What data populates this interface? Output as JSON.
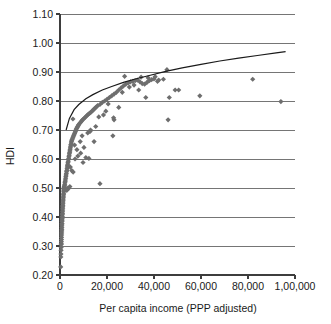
{
  "chart_data": {
    "type": "scatter",
    "title": "",
    "xlabel": "Per capita income (PPP adjusted)",
    "ylabel": "HDI",
    "xlim": [
      0,
      100000
    ],
    "ylim": [
      0.2,
      1.1
    ],
    "grid": "horizontal",
    "legend": "none",
    "marker_style": "diamond",
    "marker_color": "#6e6e6e",
    "trend_line_color": "#1a1a1a",
    "xticks": [
      0,
      20000,
      40000,
      60000,
      80000,
      100000
    ],
    "xtick_labels": [
      "0",
      "20,000",
      "40,000",
      "60,000",
      "80,000",
      "1,00,000"
    ],
    "yticks": [
      0.2,
      0.3,
      0.4,
      0.5,
      0.6,
      0.7,
      0.8,
      0.9,
      1.0,
      1.1
    ],
    "ytick_labels": [
      "0.20",
      "0.30",
      "0.40",
      "0.50",
      "0.60",
      "0.70",
      "0.80",
      "0.90",
      "1.00",
      "1.10"
    ],
    "series": [
      {
        "name": "Countries",
        "points": [
          [
            300,
            0.228
          ],
          [
            350,
            0.262
          ],
          [
            420,
            0.272
          ],
          [
            450,
            0.285
          ],
          [
            500,
            0.295
          ],
          [
            520,
            0.305
          ],
          [
            560,
            0.308
          ],
          [
            600,
            0.315
          ],
          [
            640,
            0.322
          ],
          [
            660,
            0.33
          ],
          [
            700,
            0.338
          ],
          [
            720,
            0.345
          ],
          [
            760,
            0.352
          ],
          [
            790,
            0.358
          ],
          [
            820,
            0.365
          ],
          [
            840,
            0.372
          ],
          [
            860,
            0.378
          ],
          [
            900,
            0.385
          ],
          [
            930,
            0.39
          ],
          [
            960,
            0.396
          ],
          [
            990,
            0.402
          ],
          [
            1010,
            0.408
          ],
          [
            1050,
            0.412
          ],
          [
            1080,
            0.418
          ],
          [
            1120,
            0.424
          ],
          [
            1150,
            0.43
          ],
          [
            1180,
            0.435
          ],
          [
            1220,
            0.44
          ],
          [
            1260,
            0.446
          ],
          [
            1300,
            0.452
          ],
          [
            1340,
            0.458
          ],
          [
            1380,
            0.462
          ],
          [
            1420,
            0.468
          ],
          [
            1460,
            0.472
          ],
          [
            1500,
            0.478
          ],
          [
            1540,
            0.482
          ],
          [
            1580,
            0.488
          ],
          [
            1620,
            0.492
          ],
          [
            1680,
            0.496
          ],
          [
            1720,
            0.5
          ],
          [
            1760,
            0.502
          ],
          [
            1800,
            0.505
          ],
          [
            1850,
            0.498
          ],
          [
            1900,
            0.494
          ],
          [
            1950,
            0.508
          ],
          [
            2000,
            0.512
          ],
          [
            2100,
            0.518
          ],
          [
            2200,
            0.522
          ],
          [
            2300,
            0.528
          ],
          [
            2400,
            0.534
          ],
          [
            2500,
            0.54
          ],
          [
            2600,
            0.545
          ],
          [
            2700,
            0.55
          ],
          [
            2800,
            0.556
          ],
          [
            2900,
            0.56
          ],
          [
            3000,
            0.566
          ],
          [
            3100,
            0.572
          ],
          [
            3200,
            0.578
          ],
          [
            3300,
            0.582
          ],
          [
            3400,
            0.588
          ],
          [
            3500,
            0.592
          ],
          [
            3600,
            0.598
          ],
          [
            3700,
            0.602
          ],
          [
            3800,
            0.608
          ],
          [
            3900,
            0.612
          ],
          [
            4000,
            0.618
          ],
          [
            4100,
            0.622
          ],
          [
            4200,
            0.628
          ],
          [
            4300,
            0.632
          ],
          [
            4400,
            0.638
          ],
          [
            4500,
            0.642
          ],
          [
            4600,
            0.648
          ],
          [
            4700,
            0.65
          ],
          [
            4800,
            0.655
          ],
          [
            4900,
            0.66
          ],
          [
            5000,
            0.665
          ],
          [
            5200,
            0.668
          ],
          [
            5400,
            0.672
          ],
          [
            5600,
            0.676
          ],
          [
            5800,
            0.68
          ],
          [
            6000,
            0.684
          ],
          [
            6200,
            0.688
          ],
          [
            6400,
            0.692
          ],
          [
            6600,
            0.696
          ],
          [
            6800,
            0.7
          ],
          [
            7000,
            0.704
          ],
          [
            7200,
            0.707
          ],
          [
            7400,
            0.71
          ],
          [
            7600,
            0.713
          ],
          [
            7800,
            0.716
          ],
          [
            8000,
            0.719
          ],
          [
            8400,
            0.723
          ],
          [
            8800,
            0.727
          ],
          [
            9200,
            0.731
          ],
          [
            9600,
            0.735
          ],
          [
            10000,
            0.738
          ],
          [
            10500,
            0.742
          ],
          [
            11000,
            0.746
          ],
          [
            11500,
            0.75
          ],
          [
            12000,
            0.754
          ],
          [
            12500,
            0.757
          ],
          [
            13000,
            0.76
          ],
          [
            13500,
            0.764
          ],
          [
            14000,
            0.768
          ],
          [
            14500,
            0.772
          ],
          [
            15000,
            0.776
          ],
          [
            15500,
            0.78
          ],
          [
            16000,
            0.784
          ],
          [
            17000,
            0.788
          ],
          [
            18000,
            0.795
          ],
          [
            19000,
            0.8
          ],
          [
            20000,
            0.806
          ],
          [
            21000,
            0.812
          ],
          [
            22000,
            0.818
          ],
          [
            23000,
            0.824
          ],
          [
            24000,
            0.83
          ],
          [
            25000,
            0.838
          ],
          [
            26000,
            0.845
          ],
          [
            27000,
            0.852
          ],
          [
            28000,
            0.858
          ],
          [
            29000,
            0.862
          ],
          [
            30000,
            0.866
          ],
          [
            31000,
            0.868
          ],
          [
            32000,
            0.87
          ],
          [
            33000,
            0.872
          ],
          [
            34000,
            0.866
          ],
          [
            35000,
            0.86
          ],
          [
            36000,
            0.858
          ],
          [
            37000,
            0.864
          ],
          [
            38000,
            0.87
          ],
          [
            39000,
            0.874
          ],
          [
            40000,
            0.876
          ],
          [
            42000,
            0.872
          ],
          [
            44000,
            0.875
          ],
          [
            5500,
            0.738
          ],
          [
            6200,
            0.648
          ],
          [
            7200,
            0.632
          ],
          [
            8600,
            0.66
          ],
          [
            9800,
            0.588
          ],
          [
            11000,
            0.605
          ],
          [
            12300,
            0.602
          ],
          [
            13000,
            0.7
          ],
          [
            14500,
            0.66
          ],
          [
            17000,
            0.515
          ],
          [
            22500,
            0.68
          ],
          [
            23000,
            0.735
          ],
          [
            22800,
            0.742
          ],
          [
            25000,
            0.778
          ],
          [
            27500,
            0.885
          ],
          [
            33500,
            0.838
          ],
          [
            36500,
            0.812
          ],
          [
            45500,
            0.908
          ],
          [
            46000,
            0.735
          ],
          [
            46500,
            0.812
          ],
          [
            49000,
            0.838
          ],
          [
            50500,
            0.838
          ],
          [
            59500,
            0.818
          ],
          [
            82000,
            0.875
          ],
          [
            94000,
            0.798
          ],
          [
            3400,
            0.5
          ],
          [
            3600,
            0.498
          ],
          [
            2900,
            0.492
          ],
          [
            4200,
            0.505
          ],
          [
            5000,
            0.56
          ],
          [
            5600,
            0.555
          ],
          [
            4400,
            0.572
          ],
          [
            6400,
            0.6
          ],
          [
            7600,
            0.61
          ],
          [
            8800,
            0.62
          ],
          [
            10200,
            0.64
          ],
          [
            9400,
            0.68
          ],
          [
            11800,
            0.69
          ],
          [
            12800,
            0.695
          ],
          [
            15200,
            0.712
          ],
          [
            16500,
            0.745
          ],
          [
            18500,
            0.752
          ],
          [
            19500,
            0.765
          ],
          [
            20500,
            0.79
          ],
          [
            26500,
            0.83
          ],
          [
            29500,
            0.848
          ],
          [
            31500,
            0.855
          ],
          [
            34500,
            0.882
          ],
          [
            37500,
            0.88
          ],
          [
            40500,
            0.884
          ],
          [
            41500,
            0.868
          ]
        ]
      }
    ],
    "trend": {
      "name": "Logarithmic fit",
      "description": "Rising logarithmic curve from about 0.72 at low income to 0.97 at the right edge",
      "points": [
        [
          2600,
          0.7
        ],
        [
          4000,
          0.74
        ],
        [
          6000,
          0.77
        ],
        [
          8000,
          0.788
        ],
        [
          11000,
          0.808
        ],
        [
          14000,
          0.822
        ],
        [
          18000,
          0.838
        ],
        [
          22000,
          0.85
        ],
        [
          27000,
          0.864
        ],
        [
          32000,
          0.876
        ],
        [
          38000,
          0.888
        ],
        [
          45000,
          0.902
        ],
        [
          52000,
          0.914
        ],
        [
          60000,
          0.926
        ],
        [
          68000,
          0.938
        ],
        [
          76000,
          0.948
        ],
        [
          84000,
          0.957
        ],
        [
          92000,
          0.966
        ],
        [
          96000,
          0.97
        ]
      ]
    }
  }
}
